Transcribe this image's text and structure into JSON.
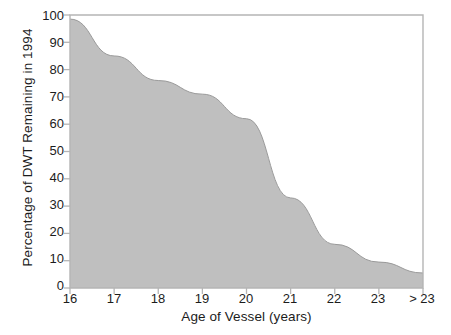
{
  "chart_data": {
    "type": "area",
    "title": "",
    "xlabel": "Age of Vessel (years)",
    "ylabel": "Percentage of DWT Remaining in 1994",
    "x_tick_labels": [
      "16",
      "17",
      "18",
      "19",
      "20",
      "21",
      "22",
      "23",
      "> 23"
    ],
    "y_tick_labels": [
      "0",
      "10",
      "20",
      "30",
      "40",
      "50",
      "60",
      "70",
      "80",
      "90",
      "100"
    ],
    "y_ticks": [
      0,
      10,
      20,
      30,
      40,
      50,
      60,
      70,
      80,
      90,
      100
    ],
    "ylim": [
      0,
      100
    ],
    "xlim": [
      16,
      24
    ],
    "grid": false,
    "legend": null,
    "series": [
      {
        "name": "Percentage of DWT Remaining in 1994",
        "categories": [
          "16",
          "17",
          "18",
          "19",
          "20",
          "21",
          "22",
          "23",
          "> 23"
        ],
        "values": [
          98.5,
          85,
          76,
          71,
          62,
          33,
          16,
          9.5,
          5.5
        ],
        "fill_color": "#bfbfbf",
        "line_color": "#9a9a9a"
      }
    ],
    "axis_color": "#b5b5b5",
    "text_color": "#1c1c1c",
    "background": "#ffffff"
  }
}
